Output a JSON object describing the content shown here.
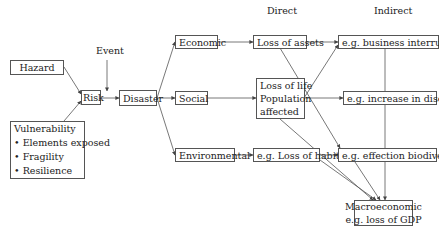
{
  "headers": {
    "direct": "Direct",
    "indirect": "Indirect"
  },
  "nodes": {
    "hazard": "Hazard",
    "event": "Event",
    "risk": "Risk",
    "disaster": "Disaster",
    "vulnerability": {
      "title": "Vulnerability",
      "items": [
        "Elements exposed",
        "Fragility",
        "Resilience"
      ]
    },
    "economic": "Economic",
    "social": "Social",
    "environmental": "Environmental",
    "loss_of_assets": "Loss of assets",
    "loss_of_life": [
      "Loss of life",
      "Population",
      "affected"
    ],
    "loss_of_habitats": "e.g. Loss of habitats",
    "business_interruption": "e.g. business interruption",
    "increase_in_diseases": "e.g. increase in diseases",
    "effection_biodiversity": "e.g. effection biodiversity",
    "macroeconomic": [
      "Macroeconomic",
      "e.g. loss of GDP"
    ]
  },
  "colors": {
    "line": "#555555",
    "text": "#222222"
  }
}
